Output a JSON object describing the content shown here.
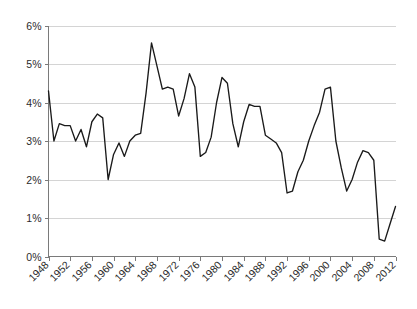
{
  "chart_data": {
    "type": "line",
    "title": "",
    "subtitle": "",
    "xlabel": "",
    "ylabel": "",
    "xlim": [
      1948,
      2012
    ],
    "ylim": [
      0,
      6
    ],
    "grid": true,
    "legend": null,
    "legend_position": "none",
    "y_tick_labels": [
      "0%",
      "1%",
      "2%",
      "3%",
      "4%",
      "5%",
      "6%"
    ],
    "y_tick_values": [
      0,
      1,
      2,
      3,
      4,
      5,
      6
    ],
    "x_tick_labels": [
      "1948",
      "1952",
      "1956",
      "1960",
      "1964",
      "1968",
      "1972",
      "1976",
      "1980",
      "1984",
      "1988",
      "1992",
      "1996",
      "2000",
      "2004",
      "2008",
      "2012"
    ],
    "x_tick_values": [
      1948,
      1952,
      1956,
      1960,
      1964,
      1968,
      1972,
      1976,
      1980,
      1984,
      1988,
      1992,
      1996,
      2000,
      2004,
      2008,
      2012
    ],
    "x": [
      1948,
      1949,
      1950,
      1951,
      1952,
      1953,
      1954,
      1955,
      1956,
      1957,
      1958,
      1959,
      1960,
      1961,
      1962,
      1963,
      1964,
      1965,
      1966,
      1967,
      1968,
      1969,
      1970,
      1971,
      1972,
      1973,
      1974,
      1975,
      1976,
      1977,
      1978,
      1979,
      1980,
      1981,
      1982,
      1983,
      1984,
      1985,
      1986,
      1987,
      1988,
      1989,
      1990,
      1991,
      1992,
      1993,
      1994,
      1995,
      1996,
      1997,
      1998,
      1999,
      2000,
      2001,
      2002,
      2003,
      2004,
      2005,
      2006,
      2007,
      2008,
      2009,
      2010,
      2011,
      2012
    ],
    "values": [
      4.3,
      3.0,
      3.45,
      3.4,
      3.4,
      3.0,
      3.3,
      2.85,
      3.5,
      3.7,
      3.6,
      2.0,
      2.65,
      2.95,
      2.6,
      3.0,
      3.15,
      3.2,
      4.25,
      5.55,
      4.95,
      4.35,
      4.4,
      4.35,
      3.65,
      4.1,
      4.75,
      4.4,
      2.6,
      2.7,
      3.1,
      4.0,
      4.65,
      4.5,
      3.45,
      2.85,
      3.5,
      3.95,
      3.9,
      3.9,
      3.15,
      3.05,
      2.95,
      2.7,
      1.65,
      1.7,
      2.2,
      2.5,
      3.0,
      3.4,
      3.75,
      4.35,
      4.4,
      3.0,
      2.3,
      1.7,
      2.0,
      2.45,
      2.75,
      2.7,
      2.5,
      0.45,
      0.4,
      0.85,
      1.3
    ],
    "series_name": "",
    "line_color": "#1a1a1a",
    "grid_color": "#c9c9c9",
    "axis_color": "#7a7a7a"
  }
}
